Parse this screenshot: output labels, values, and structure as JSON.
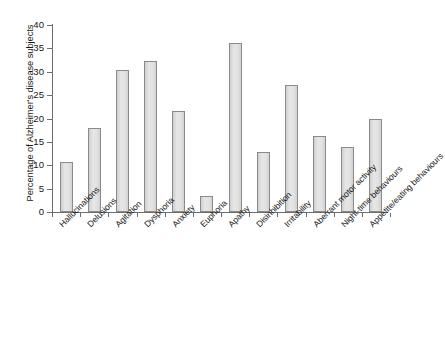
{
  "chart_data": {
    "type": "bar",
    "title": "",
    "subtitle": "",
    "xlabel": "",
    "ylabel": "Percentage of Alzheimer's disease subjects",
    "ylim": [
      0,
      40
    ],
    "yticks": [
      0,
      5,
      10,
      15,
      20,
      25,
      30,
      35,
      40
    ],
    "ytick_labels": [
      "0",
      "5",
      "10",
      "15",
      "20",
      "25",
      "30",
      "35",
      "40"
    ],
    "grid": false,
    "legend": null,
    "legend_position": "none",
    "bar_fill_color": "#dedede",
    "bar_edge_color": "#8a8a8a",
    "axis_color": "#6d6d6d",
    "background_color": "#ffffff",
    "categories": [
      "Hallucinations",
      "Delusions",
      "Agitation",
      "Dysphoria",
      "Anxiety",
      "Euphoria",
      "Apathy",
      "Disinhibition",
      "Irritability",
      "Aberrant motor activity",
      "Night-time behaviours",
      "Appetite/eating  behaviours"
    ],
    "values": [
      10.7,
      18.0,
      30.4,
      32.4,
      21.6,
      3.4,
      36.1,
      12.8,
      27.2,
      16.2,
      13.9,
      19.8
    ]
  }
}
